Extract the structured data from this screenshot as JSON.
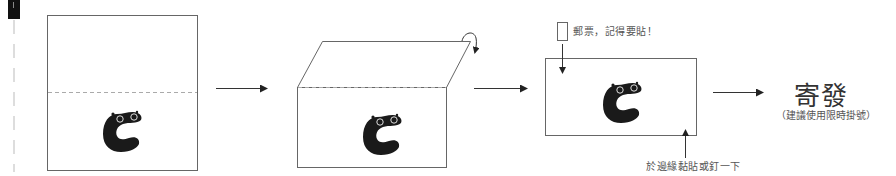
{
  "diagram": {
    "steps": [
      {
        "id": "step-1",
        "description": "Flat sheet with dashed fold line, mascot on lower half"
      },
      {
        "id": "step-2",
        "description": "Top half folded back along the dashed line"
      },
      {
        "id": "step-3",
        "description": "Folded card"
      },
      {
        "id": "step-4",
        "description": "Send"
      }
    ],
    "annotations": {
      "stamp_note": "郵票，記得要貼！",
      "edge_note": "於邊緣黏貼或釘一下",
      "send_title": "寄發",
      "send_subtitle": "（建議使用限時掛號）"
    },
    "icons": {
      "mascot": "mascot-c-icon",
      "stamp": "stamp-box-icon",
      "fold": "curved-fold-arrow-icon",
      "arrow": "right-arrow-icon"
    },
    "colors": {
      "line": "#666666",
      "dashed": "#aaaaaa",
      "mascot": "#1a1a1a",
      "arrow": "#222222"
    }
  }
}
